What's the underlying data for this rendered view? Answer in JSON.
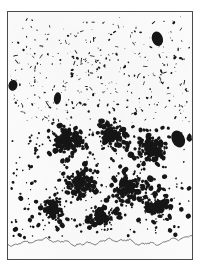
{
  "figure": {
    "kind": "micrograph-plate",
    "caption": "",
    "frame": {
      "border_color": "#4a4a4a",
      "border_width_px": 1.5,
      "x": 7,
      "y": 11,
      "width": 186,
      "height": 249
    },
    "background_color": "#fdfdfd",
    "particle_color": "#161616",
    "baseline_color": "#6b6b6b"
  },
  "chart_data": {
    "type": "scatter",
    "title": "",
    "subtitle": "",
    "xlabel": "",
    "ylabel": "",
    "xlim": [
      0,
      186
    ],
    "ylim": [
      0,
      249
    ],
    "grid": false,
    "legend_position": "none",
    "annotations": [],
    "tick_labels": {
      "x": [],
      "y": []
    },
    "regions": [
      {
        "name": "sparse-upper-field",
        "y_range": [
          4,
          112
        ],
        "particle_count": 300,
        "size_range_px": [
          0.8,
          3.2
        ],
        "elongation": "high",
        "density": "low"
      },
      {
        "name": "dense-lower-aggregate",
        "y_range": [
          108,
          232
        ],
        "particle_count": 1150,
        "size_range_px": [
          1.6,
          6.0
        ],
        "elongation": "low",
        "density": "high"
      }
    ],
    "macro_blobs": [
      {
        "name": "upper-right-blob",
        "cx": 151,
        "cy": 27,
        "rx": 5.5,
        "ry": 7.5,
        "rot": -18
      },
      {
        "name": "left-edge-blob",
        "cx": 5,
        "cy": 74,
        "rx": 4.5,
        "ry": 5.5,
        "rot": 12
      },
      {
        "name": "mid-left-blob",
        "cx": 50,
        "cy": 87,
        "rx": 3.6,
        "ry": 6.2,
        "rot": 8
      },
      {
        "name": "lower-right-patch",
        "cx": 172,
        "cy": 128,
        "rx": 6.5,
        "ry": 9.0,
        "rot": -25
      }
    ],
    "baseline": {
      "name": "ground-trace",
      "y_mean": 232,
      "amplitude_px": 4.5,
      "color": "#6b6b6b",
      "width_px": 0.9
    },
    "cluster_seeds": [
      {
        "cx": 60,
        "cy": 130,
        "r": 34,
        "n": 210
      },
      {
        "cx": 104,
        "cy": 124,
        "r": 30,
        "n": 175
      },
      {
        "cx": 146,
        "cy": 138,
        "r": 32,
        "n": 185
      },
      {
        "cx": 72,
        "cy": 172,
        "r": 36,
        "n": 200
      },
      {
        "cx": 122,
        "cy": 178,
        "r": 34,
        "n": 190
      },
      {
        "cx": 46,
        "cy": 200,
        "r": 26,
        "n": 120
      },
      {
        "cx": 150,
        "cy": 196,
        "r": 28,
        "n": 130
      },
      {
        "cx": 96,
        "cy": 206,
        "r": 30,
        "n": 140
      }
    ]
  }
}
